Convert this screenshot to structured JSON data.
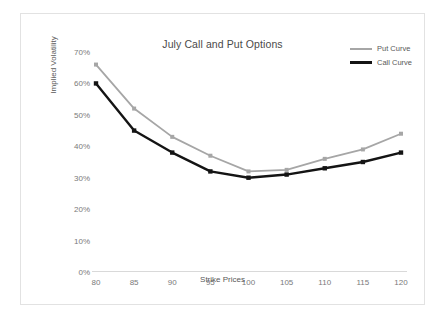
{
  "chart_data": {
    "type": "line",
    "title": "July Call and Put Options",
    "xlabel": "Strike Prices",
    "ylabel": "Implied Volatility",
    "categories": [
      80,
      85,
      90,
      95,
      100,
      105,
      110,
      115,
      120
    ],
    "x": [
      80,
      85,
      90,
      95,
      100,
      105,
      110,
      115,
      120
    ],
    "series": [
      {
        "name": "Put Curve",
        "color": "#A6A6A6",
        "values": [
          66,
          52,
          43,
          37,
          32,
          32.5,
          36,
          39,
          44
        ]
      },
      {
        "name": "Call Curve",
        "color": "#141414",
        "values": [
          60,
          45,
          38,
          32,
          30,
          31,
          33,
          35,
          38
        ]
      }
    ],
    "xlim": [
      80,
      120
    ],
    "ylim": [
      0,
      70
    ],
    "ytick_labels": [
      "70%",
      "60%",
      "50%",
      "40%",
      "30%",
      "20%",
      "10%",
      "0%"
    ],
    "ytick_values": [
      70,
      60,
      50,
      40,
      30,
      20,
      10,
      0
    ],
    "xtick_labels": [
      "80",
      "85",
      "90",
      "95",
      "100",
      "105",
      "110",
      "115",
      "120"
    ],
    "grid": false,
    "legend_position": "top-right",
    "value_unit": "percent"
  },
  "legend": {
    "entries": [
      {
        "label": "Put Curve"
      },
      {
        "label": "Call Curve"
      }
    ]
  }
}
